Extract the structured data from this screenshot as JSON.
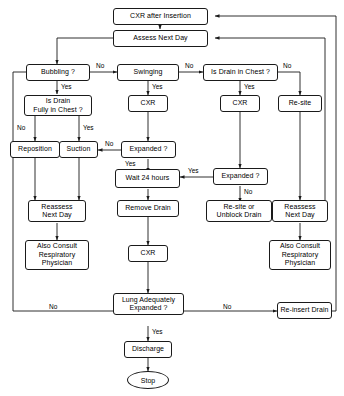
{
  "diagram": {
    "width": 344,
    "height": 396,
    "stroke_color": "#1a1a1a",
    "background_color": "#ffffff"
  },
  "nodes": {
    "cxr_after_insertion": {
      "label": "CXR after Insertion",
      "shape": "process"
    },
    "assess_next_day": {
      "label": "Assess Next Day",
      "shape": "process"
    },
    "bubbling": {
      "label": "Bubbling ?",
      "shape": "decision"
    },
    "swinging": {
      "label": "Swinging",
      "shape": "decision"
    },
    "is_drain_in_chest": {
      "label": "Is Drain in Chest ?",
      "shape": "decision"
    },
    "is_drain_fully_in_chest": {
      "label": "Is Drain\nFully in Chest ?",
      "shape": "decision"
    },
    "cxr_mid": {
      "label": "CXR",
      "shape": "process"
    },
    "cxr_right": {
      "label": "CXR",
      "shape": "process"
    },
    "re_site": {
      "label": "Re-site",
      "shape": "process"
    },
    "reposition": {
      "label": "Reposition",
      "shape": "process"
    },
    "suction": {
      "label": "Suction",
      "shape": "process"
    },
    "expanded_mid": {
      "label": "Expanded ?",
      "shape": "decision"
    },
    "expanded_right": {
      "label": "Expanded ?",
      "shape": "decision"
    },
    "wait_24_hours": {
      "label": "Wait 24 hours",
      "shape": "process"
    },
    "reassess_next_day_left": {
      "label": "Reassess\nNext Day",
      "shape": "process"
    },
    "reassess_next_day_right": {
      "label": "Reassess\nNext Day",
      "shape": "process"
    },
    "remove_drain": {
      "label": "Remove Drain",
      "shape": "process"
    },
    "re_site_or_unblock_drain": {
      "label": "Re-site or\nUnblock Drain",
      "shape": "process"
    },
    "also_consult_left": {
      "label": "Also Consult\nRespiratory\nPhysician",
      "shape": "process"
    },
    "also_consult_right": {
      "label": "Also Consult\nRespiratory\nPhysician",
      "shape": "process"
    },
    "cxr_bottom": {
      "label": "CXR",
      "shape": "process"
    },
    "lung_adequately_expanded": {
      "label": "Lung Adequately\nExpanded ?",
      "shape": "decision"
    },
    "re_insert_drain": {
      "label": "Re-insert Drain",
      "shape": "process"
    },
    "discharge": {
      "label": "Discharge",
      "shape": "process"
    },
    "stop": {
      "label": "Stop",
      "shape": "terminator"
    }
  },
  "edge_labels": {
    "bubbling_no": "No",
    "bubbling_yes": "Yes",
    "swinging_no": "No",
    "swinging_yes": "Yes",
    "drain_in_chest_no": "No",
    "drain_in_chest_yes": "Yes",
    "fully_in_chest_no": "No",
    "fully_in_chest_yes": "Yes",
    "expanded_mid_no": "No",
    "expanded_mid_yes": "Yes",
    "expanded_right_yes": "Yes",
    "expanded_right_no": "No",
    "lung_expanded_no_left": "No",
    "lung_expanded_no_right": "No",
    "lung_expanded_yes": "Yes"
  }
}
